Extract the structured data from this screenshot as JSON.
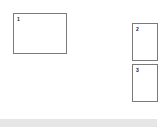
{
  "diagram": {
    "boxes": [
      {
        "label": "1"
      },
      {
        "label": "2"
      },
      {
        "label": "3"
      }
    ],
    "colors": {
      "box_border": "#7a7a7a",
      "background": "#ffffff",
      "bar": "#e6e6e6"
    }
  }
}
